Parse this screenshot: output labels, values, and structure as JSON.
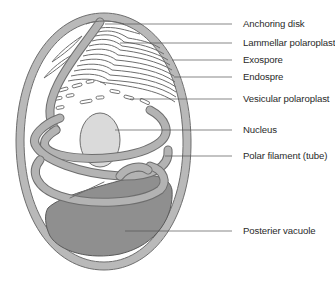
{
  "diagram": {
    "colors": {
      "outer_wall": "#b9b9b9",
      "outline": "#6e6e6e",
      "filament": "#b3b3b3",
      "nucleus": "#dadada",
      "vacuole": "#8f8f8f",
      "leader_line": "#555555",
      "label_text": "#2a2a2a"
    },
    "labels": [
      {
        "id": "anchoring-disk",
        "text": "Anchoring disk",
        "y": 24,
        "line_x1": 105
      },
      {
        "id": "lammellar-polaroplast",
        "text": "Lammellar polaroplast",
        "y": 43,
        "line_x1": 120
      },
      {
        "id": "exospore",
        "text": "Exospore",
        "y": 60,
        "line_x1": 172
      },
      {
        "id": "endospre",
        "text": "Endospre",
        "y": 77,
        "line_x1": 174
      },
      {
        "id": "vesicular-polaroplast",
        "text": "Vesicular polaroplast",
        "y": 99,
        "line_x1": 130
      },
      {
        "id": "nucleus",
        "text": "Nucleus",
        "y": 130,
        "line_x1": 115
      },
      {
        "id": "polar-filament",
        "text": "Polar filament (tube)",
        "y": 156,
        "line_x1": 165
      },
      {
        "id": "posterier-vacuole",
        "text": "Posterier vacuole",
        "y": 231,
        "line_x1": 125
      }
    ]
  }
}
